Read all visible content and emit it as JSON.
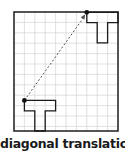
{
  "caption": "diagonal translation",
  "colors": {
    "grid": "#d4d4d4",
    "frame": "#2b2b2b",
    "shape": "#1a1a1a",
    "arrow": "#555555",
    "point": "#111111"
  },
  "grid": {
    "columns": 10,
    "rows": 11.5
  },
  "shapes": {
    "original": {
      "label": "T-shape original",
      "anchor_cell": [
        1,
        8.5
      ]
    },
    "translated": {
      "label": "T-shape translated",
      "anchor_cell": [
        7,
        -0.25
      ]
    }
  },
  "translation_vector": {
    "dx_cells": 6,
    "dy_cells": -8.75,
    "style": "dashed-arrow"
  }
}
